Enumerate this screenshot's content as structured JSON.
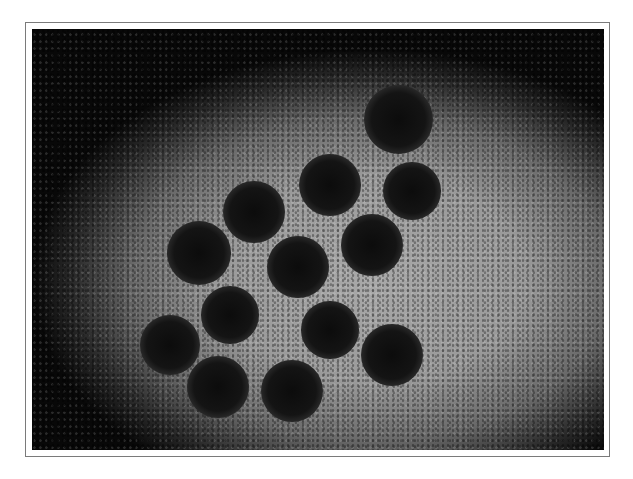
{
  "image": {
    "description": "Electron micrograph of spherical virus particles (dark spiked spheres) on a grey negatively stained background",
    "particles": [
      {
        "x": 366,
        "y": 90,
        "r": 30
      },
      {
        "x": 298,
        "y": 156,
        "r": 27
      },
      {
        "x": 380,
        "y": 162,
        "r": 25
      },
      {
        "x": 222,
        "y": 183,
        "r": 27
      },
      {
        "x": 340,
        "y": 216,
        "r": 27
      },
      {
        "x": 167,
        "y": 224,
        "r": 28
      },
      {
        "x": 266,
        "y": 238,
        "r": 27
      },
      {
        "x": 198,
        "y": 286,
        "r": 25
      },
      {
        "x": 298,
        "y": 301,
        "r": 25
      },
      {
        "x": 138,
        "y": 316,
        "r": 26
      },
      {
        "x": 360,
        "y": 326,
        "r": 27
      },
      {
        "x": 186,
        "y": 358,
        "r": 27
      },
      {
        "x": 260,
        "y": 362,
        "r": 27
      }
    ]
  }
}
